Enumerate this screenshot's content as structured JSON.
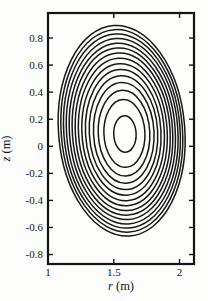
{
  "figure": {
    "background": "#fdfdfc",
    "line_color": "#171717"
  },
  "chart_data": {
    "type": "contour",
    "title": "",
    "xlabel": "r (m)",
    "ylabel": "z (m)",
    "xlabel_var": "r",
    "xlabel_unit": " (m)",
    "ylabel_var": "z",
    "ylabel_unit": " (m)",
    "xlim": [
      1.0,
      2.11
    ],
    "ylim": [
      -0.87,
      0.985
    ],
    "grid": false,
    "frame": "box with mirrored inward ticks on all four sides",
    "xticks": {
      "values": [
        1,
        1.5,
        2
      ],
      "labels": [
        "1",
        "1.5",
        "2"
      ]
    },
    "yticks": {
      "values": [
        -0.8,
        -0.6,
        -0.4,
        -0.2,
        0,
        0.2,
        0.4,
        0.6,
        0.8
      ],
      "labels": [
        "-0.8",
        "-0.6",
        "-0.4",
        "-0.2",
        "0",
        "0.2",
        "0.4",
        "0.6",
        "0.8"
      ]
    },
    "n_contours": 15,
    "contours": [
      {
        "cr": 1.56,
        "cz": 0.115,
        "a": 0.48,
        "b": 0.78,
        "tilt": -4.5
      },
      {
        "cr": 1.561,
        "cz": 0.114,
        "a": 0.461,
        "b": 0.75,
        "tilt": -4.4
      },
      {
        "cr": 1.562,
        "cz": 0.113,
        "a": 0.442,
        "b": 0.719,
        "tilt": -4.3
      },
      {
        "cr": 1.564,
        "cz": 0.111,
        "a": 0.423,
        "b": 0.687,
        "tilt": -4.1
      },
      {
        "cr": 1.565,
        "cz": 0.11,
        "a": 0.402,
        "b": 0.653,
        "tilt": -4.0
      },
      {
        "cr": 1.566,
        "cz": 0.109,
        "a": 0.381,
        "b": 0.619,
        "tilt": -3.9
      },
      {
        "cr": 1.568,
        "cz": 0.107,
        "a": 0.36,
        "b": 0.583,
        "tilt": -3.7
      },
      {
        "cr": 1.569,
        "cz": 0.106,
        "a": 0.337,
        "b": 0.546,
        "tilt": -3.6
      },
      {
        "cr": 1.571,
        "cz": 0.104,
        "a": 0.313,
        "b": 0.507,
        "tilt": -3.4
      },
      {
        "cr": 1.572,
        "cz": 0.103,
        "a": 0.287,
        "b": 0.465,
        "tilt": -3.3
      },
      {
        "cr": 1.574,
        "cz": 0.101,
        "a": 0.26,
        "b": 0.421,
        "tilt": -3.1
      },
      {
        "cr": 1.576,
        "cz": 0.099,
        "a": 0.23,
        "b": 0.372,
        "tilt": -2.9
      },
      {
        "cr": 1.578,
        "cz": 0.097,
        "a": 0.196,
        "b": 0.317,
        "tilt": -2.7
      },
      {
        "cr": 1.581,
        "cz": 0.095,
        "a": 0.156,
        "b": 0.251,
        "tilt": -2.5
      },
      {
        "cr": 1.585,
        "cz": 0.09,
        "a": 0.085,
        "b": 0.135,
        "tilt": -2.0
      }
    ]
  }
}
